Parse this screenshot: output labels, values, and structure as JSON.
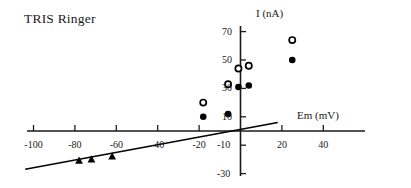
{
  "chart_title": "TRIS Ringer",
  "axes": {
    "x_label": "Em (mV)",
    "y_label": "I (nA)",
    "x_ticks": [
      "-100",
      "-80",
      "-60",
      "-40",
      "-20",
      "20",
      "40"
    ],
    "y_ticks": [
      "70",
      "50",
      "30",
      "10",
      "-10",
      "-30"
    ]
  },
  "chart_data": {
    "type": "scatter",
    "title": "TRIS Ringer",
    "xlabel": "Em (mV)",
    "ylabel": "I (nA)",
    "xlim": [
      -104,
      42
    ],
    "ylim": [
      -32,
      72
    ],
    "grid": false,
    "legend": "none",
    "x_ticks": [
      -100,
      -80,
      -60,
      -40,
      -20,
      20,
      40
    ],
    "y_ticks": [
      70,
      50,
      30,
      10,
      -10,
      -30
    ],
    "series": [
      {
        "name": "open-circles",
        "marker": "open-circle",
        "color": "#000000",
        "points": [
          {
            "x": -18,
            "y": 20
          },
          {
            "x": -6,
            "y": 33
          },
          {
            "x": -1,
            "y": 44
          },
          {
            "x": 4,
            "y": 46
          },
          {
            "x": 25,
            "y": 64
          }
        ]
      },
      {
        "name": "filled-circles",
        "marker": "filled-circle",
        "color": "#000000",
        "points": [
          {
            "x": -18,
            "y": 10
          },
          {
            "x": -6,
            "y": 12
          },
          {
            "x": -1,
            "y": 31
          },
          {
            "x": 4,
            "y": 32
          },
          {
            "x": 25,
            "y": 50
          }
        ]
      },
      {
        "name": "filled-triangles",
        "marker": "filled-triangle",
        "color": "#000000",
        "points": [
          {
            "x": -78,
            "y": -21
          },
          {
            "x": -72,
            "y": -20
          },
          {
            "x": -62,
            "y": -18
          }
        ]
      }
    ],
    "fit_line": {
      "name": "regression-line",
      "x_start": -104,
      "y_start": -27,
      "x_end": 18,
      "y_end": 6
    }
  }
}
